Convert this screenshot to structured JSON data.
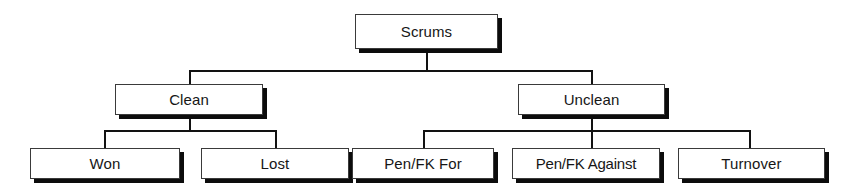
{
  "diagram": {
    "type": "tree-diagram",
    "background_color": "#ffffff",
    "box_fill_color": "#ffffff",
    "box_border_color": "#3a3a3a",
    "shadow_color": "#0c0c0c",
    "connector_color": "#121212",
    "nodes": {
      "root": {
        "label": "Scrums"
      },
      "clean": {
        "label": "Clean"
      },
      "unclean": {
        "label": "Unclean"
      },
      "won": {
        "label": "Won"
      },
      "lost": {
        "label": "Lost"
      },
      "pen_fk_for": {
        "label": "Pen/FK For"
      },
      "pen_fk_against": {
        "label": "Pen/FK Against"
      },
      "turnover": {
        "label": "Turnover"
      }
    }
  }
}
